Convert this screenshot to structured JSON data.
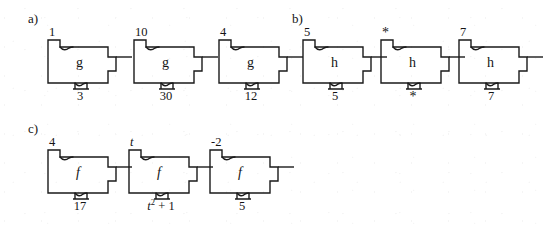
{
  "figure": {
    "background_color": "#ffffff",
    "ink_color": "#1a1a1a",
    "stroke_width": 1.4
  },
  "parts": [
    {
      "id": "part-a",
      "label": "a)",
      "label_x": 28,
      "label_y": 12,
      "machines": [
        {
          "id": "a1",
          "function_label": "g",
          "function_style": "roman",
          "input": "1",
          "input_style": "roman",
          "output": "3",
          "output_style": "roman",
          "x": 42,
          "y": 26
        },
        {
          "id": "a2",
          "function_label": "g",
          "function_style": "roman",
          "input": "10",
          "input_style": "roman",
          "output": "30",
          "output_style": "roman",
          "x": 128,
          "y": 26
        },
        {
          "id": "a3",
          "function_label": "g",
          "function_style": "roman",
          "input": "4",
          "input_style": "roman",
          "output": "12",
          "output_style": "roman",
          "x": 213,
          "y": 26
        }
      ]
    },
    {
      "id": "part-b",
      "label": "b)",
      "label_x": 292,
      "label_y": 12,
      "machines": [
        {
          "id": "b1",
          "function_label": "h",
          "function_style": "roman",
          "input": "5",
          "input_style": "roman",
          "output": "5",
          "output_style": "roman",
          "x": 297,
          "y": 26
        },
        {
          "id": "b2",
          "function_label": "h",
          "function_style": "roman",
          "input": "*",
          "input_style": "roman",
          "output": "*",
          "output_style": "roman",
          "x": 375,
          "y": 26
        },
        {
          "id": "b3",
          "function_label": "h",
          "function_style": "roman",
          "input": "7",
          "input_style": "roman",
          "output": "7",
          "output_style": "roman",
          "x": 453,
          "y": 26
        }
      ]
    },
    {
      "id": "part-c",
      "label": "c)",
      "label_x": 28,
      "label_y": 122,
      "machines": [
        {
          "id": "c1",
          "function_label": "f",
          "function_style": "italic",
          "input": "4",
          "input_style": "roman",
          "output": "17",
          "output_style": "roman",
          "x": 42,
          "y": 136
        },
        {
          "id": "c2",
          "function_label": "f",
          "function_style": "italic",
          "input": "t",
          "input_style": "italic",
          "output": "t2+1",
          "output_html": "<span class=\"italic-var\">t</span><sup>2</sup> + 1",
          "output_style": "italic",
          "x": 123,
          "y": 136
        },
        {
          "id": "c3",
          "function_label": "f",
          "function_style": "italic",
          "input": "-2",
          "input_style": "roman",
          "output": "5",
          "output_style": "roman",
          "x": 204,
          "y": 136
        }
      ]
    }
  ]
}
